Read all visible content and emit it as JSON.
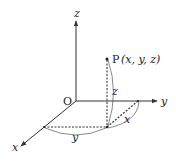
{
  "diagram": {
    "origin_label": "O",
    "axes": {
      "x_label": "x",
      "y_label": "y",
      "z_label": "z"
    },
    "point": {
      "label": "P",
      "coords": "(x, y, z)"
    },
    "measures": {
      "z_length": "z",
      "x_length": "x",
      "y_length": "y"
    },
    "colors": {
      "line": "#333333",
      "background": "#ffffff"
    }
  }
}
